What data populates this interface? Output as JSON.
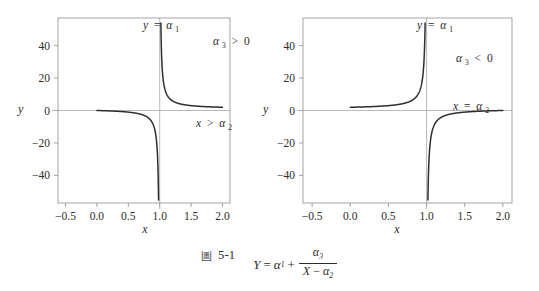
{
  "figure": {
    "caption_marker": "圖",
    "caption_number": "5-1",
    "formula": {
      "lhs": "Y",
      "eq": "=",
      "term1": "α",
      "term1_sub": "1",
      "plus": "+",
      "numerator": "α",
      "numerator_sub": "3",
      "den_var": "X",
      "den_minus": "−",
      "den_term": "α",
      "den_sub": "2"
    }
  },
  "panels": [
    {
      "id": "left",
      "xlabel": "x",
      "ylabel": "y",
      "xticks": [
        "-0.5",
        "0.0",
        "0.5",
        "1.0",
        "1.5",
        "2.0"
      ],
      "xtick_values": [
        -0.5,
        0.0,
        0.5,
        1.0,
        1.5,
        2.0
      ],
      "yticks": [
        "40",
        "20",
        "0",
        "-20",
        "-40"
      ],
      "ytick_values": [
        40,
        20,
        0,
        -20,
        -40
      ],
      "annotations": [
        {
          "name": "asymptote-y-label",
          "base": "y",
          "op": "=",
          "sym": "α",
          "sub": "1"
        },
        {
          "name": "alpha3-sign-label",
          "base": "α",
          "base_sub": "3",
          "op": ">",
          "sym": "0"
        },
        {
          "name": "domain-label",
          "base": "x",
          "op": ">",
          "sym": "α",
          "sub": "2"
        }
      ]
    },
    {
      "id": "right",
      "xlabel": "x",
      "ylabel": "y",
      "xticks": [
        "-0.5",
        "0.0",
        "0.5",
        "1.0",
        "1.5",
        "2.0"
      ],
      "xtick_values": [
        -0.5,
        0.0,
        0.5,
        1.0,
        1.5,
        2.0
      ],
      "yticks": [
        "40",
        "20",
        "0",
        "-20",
        "-40"
      ],
      "ytick_values": [
        40,
        20,
        0,
        -20,
        -40
      ],
      "annotations": [
        {
          "name": "asymptote-y-label",
          "base": "y",
          "op": "=",
          "sym": "α",
          "sub": "1"
        },
        {
          "name": "alpha3-sign-label",
          "base": "α",
          "base_sub": "3",
          "op": "<",
          "sym": "0"
        },
        {
          "name": "asymptote-x-label",
          "base": "x",
          "op": "=",
          "sym": "α",
          "sub": "2"
        }
      ]
    }
  ],
  "chart_data": [
    {
      "type": "line",
      "title": "",
      "panel": "left",
      "xlabel": "x",
      "ylabel": "y",
      "xlim": [
        -0.62,
        2.12
      ],
      "ylim": [
        -57,
        57
      ],
      "grid": false,
      "legend": null,
      "function": "y = a1 + a3/(x - a2)",
      "params": {
        "a1": 1.0,
        "a2": 1.0,
        "a3": 1.0
      },
      "note": "a3 > 0; vertical asymptote at x = a2 = 1, horizontal asymptote y = a1 = 1",
      "branches": [
        {
          "name": "left-branch",
          "x": [
            0.0,
            0.1,
            0.2,
            0.3,
            0.4,
            0.5,
            0.6,
            0.7,
            0.8,
            0.85,
            0.9,
            0.93,
            0.95,
            0.97,
            0.98,
            0.985
          ],
          "y": [
            0.0,
            -0.111,
            -0.25,
            -0.4286,
            -0.6667,
            -1.0,
            -1.5,
            -2.333,
            -4.0,
            -5.667,
            -9.0,
            -13.29,
            -19.0,
            -32.33,
            -49.0,
            -65.67
          ]
        },
        {
          "name": "right-branch",
          "x": [
            1.018,
            1.02,
            1.025,
            1.03,
            1.04,
            1.05,
            1.07,
            1.1,
            1.15,
            1.2,
            1.3,
            1.4,
            1.5,
            1.6,
            1.7,
            1.8,
            1.9,
            2.0
          ],
          "y": [
            56.6,
            51.0,
            41.0,
            34.33,
            26.0,
            21.0,
            15.29,
            11.0,
            7.667,
            6.0,
            4.333,
            3.5,
            3.0,
            2.667,
            2.429,
            2.25,
            2.111,
            2.0
          ]
        }
      ]
    },
    {
      "type": "line",
      "title": "",
      "panel": "right",
      "xlabel": "x",
      "ylabel": "y",
      "xlim": [
        -0.62,
        2.12
      ],
      "ylim": [
        -57,
        57
      ],
      "grid": false,
      "legend": null,
      "function": "y = a1 + a3/(x - a2)",
      "params": {
        "a1": 1.0,
        "a2": 1.0,
        "a3": -1.0
      },
      "note": "a3 < 0; vertical asymptote at x = a2 = 1, horizontal asymptote y = a1 = 1",
      "branches": [
        {
          "name": "left-branch",
          "x": [
            0.0,
            0.1,
            0.2,
            0.3,
            0.4,
            0.5,
            0.6,
            0.7,
            0.8,
            0.85,
            0.9,
            0.93,
            0.95,
            0.97,
            0.98,
            0.985
          ],
          "y": [
            2.0,
            2.111,
            2.25,
            2.4286,
            2.667,
            3.0,
            3.5,
            4.333,
            6.0,
            7.667,
            11.0,
            15.29,
            21.0,
            34.33,
            51.0,
            67.67
          ]
        },
        {
          "name": "right-branch",
          "x": [
            1.018,
            1.02,
            1.025,
            1.03,
            1.04,
            1.05,
            1.07,
            1.1,
            1.15,
            1.2,
            1.3,
            1.4,
            1.5,
            1.6,
            1.7,
            1.8,
            1.9,
            2.0
          ],
          "y": [
            -54.6,
            -49.0,
            -39.0,
            -32.33,
            -24.0,
            -19.0,
            -13.29,
            -9.0,
            -5.667,
            -4.0,
            -2.333,
            -1.5,
            -1.0,
            -0.667,
            -0.4286,
            -0.25,
            -0.111,
            0.0
          ]
        }
      ]
    }
  ]
}
